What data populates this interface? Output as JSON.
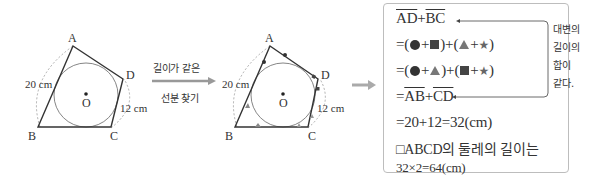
{
  "figure1": {
    "vertices": {
      "A": "A",
      "B": "B",
      "C": "C",
      "D": "D"
    },
    "center_label": "O",
    "length_ab": "20 cm",
    "length_cd": "12 cm"
  },
  "step_arrow": {
    "line1": "길이가 같은",
    "line2": "선분 찾기"
  },
  "figure2": {
    "vertices": {
      "A": "A",
      "B": "B",
      "C": "C",
      "D": "D"
    },
    "center_label": "O",
    "length_ab": "20 cm",
    "length_cd": "12 cm"
  },
  "solution": {
    "line1": {
      "seg1": "AD",
      "plus": "+",
      "seg2": "BC"
    },
    "line2_prefix": "=(",
    "line3_prefix": "=(",
    "line4": {
      "eq": "=",
      "seg1": "AB",
      "plus": "+",
      "seg2": "CD"
    },
    "line5": "=20+12=32(cm)",
    "line6": "□ABCD의 둘레의 길이는",
    "line7": "32×2=64(cm)",
    "note": [
      "대변의",
      "길이의",
      "합이",
      "같다."
    ]
  },
  "colors": {
    "stroke": "#333333",
    "arc": "#999999",
    "arrow": "#aaaaaa",
    "border": "#bdbdbd",
    "triangle": "#777777"
  }
}
